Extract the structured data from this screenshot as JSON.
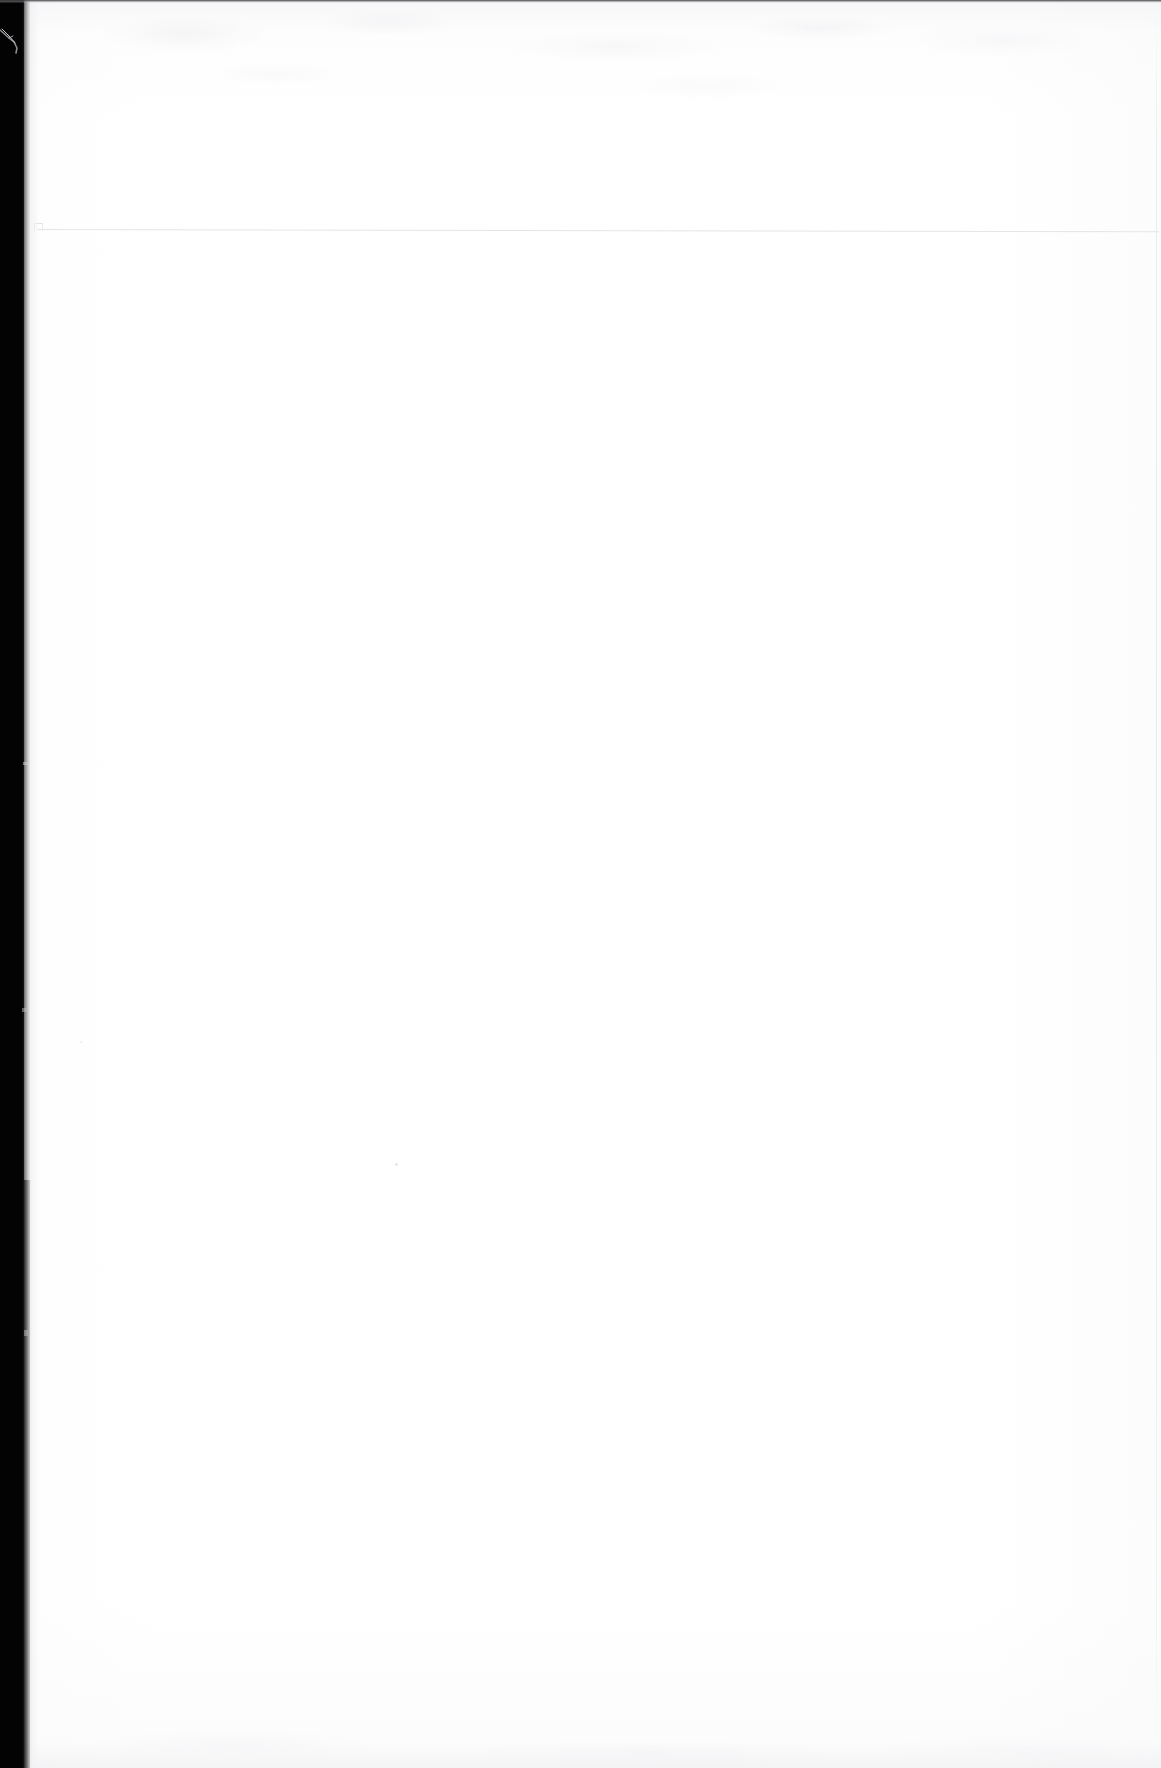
{
  "document": {
    "kind": "scanned-page",
    "page_state": "blank",
    "visible_text": "",
    "text_lines": [],
    "page_number": "",
    "heading": "",
    "body_paragraphs": []
  },
  "canvas": {
    "width_px": 1161,
    "height_px": 1768,
    "paper_color": "#ffffff",
    "background_color": "#ffffff"
  },
  "artifacts": {
    "top_border_rule": {
      "name": "top-scan-border",
      "color": "#3a3a3c",
      "x": 0,
      "y": 0,
      "width": 1161,
      "height": 3
    },
    "left_gutter": {
      "name": "binding-gutter-shadow",
      "color": "#030303",
      "x": 0,
      "y": 0,
      "width": 24,
      "height": 1768,
      "edge_note": "irregular feathered inner edge; widens slightly below y=1180"
    },
    "gutter_fiber": {
      "name": "torn-edge-fiber",
      "color": "#6e6e72",
      "x": 0,
      "y": 26,
      "width": 30,
      "height": 30
    },
    "header_rule": {
      "name": "faint-horizontal-rule",
      "color": "#e4e4e8",
      "x": 37,
      "y": 229,
      "width": 1122,
      "height": 1,
      "slope_deg": 0.12
    },
    "header_rule_notch": {
      "name": "rule-left-notch",
      "color": "#e2e2e6",
      "x": 34,
      "y": 223,
      "width": 7,
      "height": 7
    },
    "right_edge_rule": {
      "name": "right-page-edge-line",
      "color": "#e9e9ed",
      "x": 1156,
      "y": 0,
      "width": 1,
      "height": 1768
    },
    "ghost_bleed_top": {
      "name": "reverse-side-bleedthrough",
      "color": "#eceeef",
      "x": 26,
      "y": 2,
      "width": 1135,
      "height": 200
    },
    "ghost_bleed_bottom": {
      "name": "bottom-edge-shading",
      "color": "#f0f0f3",
      "x": 28,
      "y": 1690,
      "width": 1133,
      "height": 78
    },
    "specks": [
      {
        "name": "gutter-speck-upper",
        "x": 23,
        "y": 762,
        "width": 5,
        "height": 3,
        "color": "#d2d2d5"
      },
      {
        "name": "gutter-speck-middle",
        "x": 22,
        "y": 1008,
        "width": 6,
        "height": 4,
        "color": "#bebec2"
      },
      {
        "name": "gutter-speck-lower",
        "x": 24,
        "y": 1330,
        "width": 4,
        "height": 6,
        "color": "#c8c8cc"
      },
      {
        "name": "body-speck-center",
        "x": 395,
        "y": 1163,
        "width": 3,
        "height": 3,
        "color": "#ddddE0"
      },
      {
        "name": "body-speck-left",
        "x": 80,
        "y": 1041,
        "width": 2,
        "height": 2,
        "color": "#e4e4e7"
      }
    ]
  }
}
